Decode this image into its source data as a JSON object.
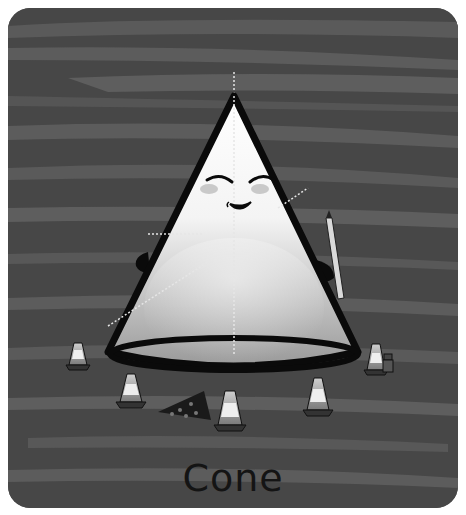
{
  "card": {
    "title": "Cone",
    "subject": "cone-character",
    "colors": {
      "background_dark": "#474747",
      "background_stripe": "#5e5e5e",
      "outline": "#0a0a0a",
      "body_light": "#ffffff",
      "body_shadow": "#8a8a8a",
      "cheek": "#c9c9c9",
      "guide_line": "#e6e6e6"
    }
  },
  "illustration": {
    "character": "smiling cone with arms holding a pencil",
    "props": [
      "traffic-cone",
      "traffic-cone",
      "traffic-cone",
      "traffic-cone",
      "traffic-cone",
      "pizza-slice",
      "small-figure"
    ]
  }
}
